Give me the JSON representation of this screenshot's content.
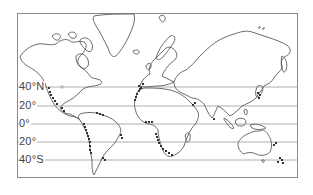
{
  "map": {
    "type": "world-outline",
    "frame": {
      "left": 17,
      "top": 13,
      "right": 298,
      "bottom": 178
    },
    "colors": {
      "coastline": "#5a5a5a",
      "latitude_line": "#9a9a9a",
      "frame": "#8a8a8a",
      "marker": "#333333",
      "background": "#ffffff"
    },
    "latitude_lines": [
      {
        "label": "40°N",
        "y": 87
      },
      {
        "label": "20°",
        "y": 106
      },
      {
        "label": "0°",
        "y": 124
      },
      {
        "label": "20°",
        "y": 142
      },
      {
        "label": "40°S",
        "y": 160
      }
    ],
    "marker_clusters": [
      {
        "name": "north-america-west-coast",
        "points": [
          [
            49,
            88
          ],
          [
            50,
            92
          ],
          [
            51,
            95
          ],
          [
            53,
            98
          ],
          [
            55,
            101
          ],
          [
            57,
            104
          ]
        ]
      },
      {
        "name": "central-america-pacific",
        "points": [
          [
            62,
            108
          ],
          [
            64,
            111
          ]
        ]
      },
      {
        "name": "caribbean-venezuela",
        "points": [
          [
            97,
            113
          ],
          [
            100,
            114
          ],
          [
            103,
            115
          ]
        ]
      },
      {
        "name": "south-america-west-coast",
        "points": [
          [
            84,
            124
          ],
          [
            85,
            127
          ],
          [
            86,
            130
          ],
          [
            87,
            133
          ],
          [
            88,
            136
          ],
          [
            89,
            139
          ],
          [
            90,
            142
          ],
          [
            90,
            146
          ],
          [
            90,
            150
          ],
          [
            91,
            153
          ]
        ]
      },
      {
        "name": "brazil-east-coast",
        "points": [
          [
            121,
            135
          ],
          [
            122,
            138
          ]
        ]
      },
      {
        "name": "argentina-coast",
        "points": [
          [
            103,
            158
          ],
          [
            105,
            160
          ]
        ]
      },
      {
        "name": "north-america-east-coast",
        "points": [
          [
            139,
            86
          ],
          [
            140,
            89
          ]
        ]
      },
      {
        "name": "africa-northwest-coast",
        "points": [
          [
            143,
            84
          ],
          [
            141,
            88
          ],
          [
            139,
            91
          ],
          [
            137,
            94
          ],
          [
            136,
            97
          ],
          [
            135,
            100
          ]
        ]
      },
      {
        "name": "gulf-of-guinea",
        "points": [
          [
            146,
            122
          ],
          [
            149,
            122
          ],
          [
            152,
            122
          ]
        ]
      },
      {
        "name": "africa-southwest-coast",
        "points": [
          [
            156,
            134
          ],
          [
            157,
            137
          ],
          [
            158,
            140
          ],
          [
            159,
            143
          ],
          [
            161,
            146
          ],
          [
            163,
            149
          ],
          [
            166,
            151
          ],
          [
            169,
            153
          ],
          [
            172,
            155
          ]
        ]
      },
      {
        "name": "arabian-coast",
        "points": [
          [
            193,
            105
          ],
          [
            195,
            103
          ]
        ]
      },
      {
        "name": "india-tip",
        "points": [
          [
            214,
            119
          ]
        ]
      },
      {
        "name": "japan",
        "points": [
          [
            258,
            93
          ],
          [
            260,
            95
          ],
          [
            259,
            98
          ]
        ]
      },
      {
        "name": "southwest-pacific",
        "points": [
          [
            274,
            145
          ],
          [
            276,
            143
          ]
        ]
      },
      {
        "name": "new-zealand",
        "points": [
          [
            280,
            158
          ],
          [
            282,
            160
          ],
          [
            278,
            162
          ],
          [
            283,
            163
          ]
        ]
      }
    ]
  }
}
